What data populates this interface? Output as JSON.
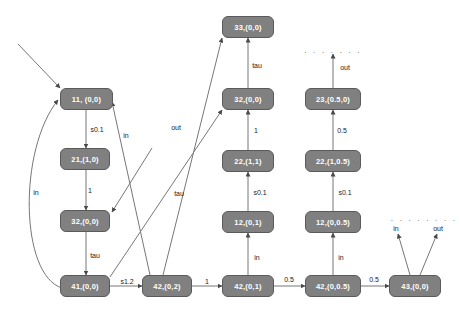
{
  "diagram": {
    "background_color": "#ffffff",
    "node_fill_color": "#808080",
    "node_text_color": "#ffffff",
    "edge_color": "#666666",
    "nodes": [
      {
        "id": "n11",
        "label": "11, (0,0)",
        "x": 60,
        "y": 88,
        "w": 53,
        "h": 22
      },
      {
        "id": "n21",
        "label": "21,(1,0)",
        "x": 60,
        "y": 148,
        "w": 50,
        "h": 22
      },
      {
        "id": "n32L",
        "label": "32,(0,0)",
        "x": 60,
        "y": 210,
        "w": 50,
        "h": 22
      },
      {
        "id": "n41",
        "label": "41,(0,0)",
        "x": 60,
        "y": 275,
        "w": 50,
        "h": 22
      },
      {
        "id": "n42_02",
        "label": "42,(0,2)",
        "x": 142,
        "y": 275,
        "w": 50,
        "h": 22
      },
      {
        "id": "n33",
        "label": "33,(0,0)",
        "x": 222,
        "y": 16,
        "w": 52,
        "h": 22
      },
      {
        "id": "n32M",
        "label": "32,(0,0)",
        "x": 222,
        "y": 88,
        "w": 52,
        "h": 22
      },
      {
        "id": "n22M",
        "label": "22,(1,1)",
        "x": 222,
        "y": 150,
        "w": 52,
        "h": 22
      },
      {
        "id": "n12M",
        "label": "12,(0,1)",
        "x": 222,
        "y": 211,
        "w": 52,
        "h": 22
      },
      {
        "id": "n42_01",
        "label": "42,(0,1)",
        "x": 222,
        "y": 275,
        "w": 52,
        "h": 22
      },
      {
        "id": "n23R",
        "label": "23,(0.5,0)",
        "x": 305,
        "y": 88,
        "w": 56,
        "h": 22
      },
      {
        "id": "n22R",
        "label": "22,(1,0.5)",
        "x": 305,
        "y": 150,
        "w": 56,
        "h": 22
      },
      {
        "id": "n12R",
        "label": "12,(0,0.5)",
        "x": 305,
        "y": 211,
        "w": 56,
        "h": 22
      },
      {
        "id": "n42_005",
        "label": "42,(0,0.5)",
        "x": 305,
        "y": 275,
        "w": 56,
        "h": 22
      },
      {
        "id": "n43",
        "label": "43,(0,0)",
        "x": 389,
        "y": 275,
        "w": 52,
        "h": 22
      }
    ],
    "edge_labels": [
      {
        "id": "lbl_s01_left",
        "text": "s0.1",
        "x": 97,
        "y": 129
      },
      {
        "id": "lbl_1_left",
        "text": "1",
        "x": 90,
        "y": 190
      },
      {
        "id": "lbl_tau_left",
        "text": "tau",
        "x": 95,
        "y": 255
      },
      {
        "id": "lbl_in_loop",
        "text": "in",
        "x": 36,
        "y": 192
      },
      {
        "id": "lbl_in_diag",
        "text": "in",
        "x": 126,
        "y": 135
      },
      {
        "id": "lbl_out_diag",
        "text": "out",
        "x": 176,
        "y": 127
      },
      {
        "id": "lbl_tau_diag",
        "text": "tau",
        "x": 179,
        "y": 193
      },
      {
        "id": "lbl_s12",
        "text": "s1.2",
        "x": 127,
        "y": 281
      },
      {
        "id": "lbl_1_bottom",
        "text": "1",
        "x": 207,
        "y": 281
      },
      {
        "id": "lbl_tau_mid",
        "text": "tau",
        "x": 257,
        "y": 65
      },
      {
        "id": "lbl_1_mid",
        "text": "1",
        "x": 256,
        "y": 130
      },
      {
        "id": "lbl_s01_mid",
        "text": "s0.1",
        "x": 260,
        "y": 192
      },
      {
        "id": "lbl_in_mid",
        "text": "in",
        "x": 257,
        "y": 257
      },
      {
        "id": "lbl_05_b1",
        "text": "0.5",
        "x": 289,
        "y": 279
      },
      {
        "id": "lbl_out_right",
        "text": "out",
        "x": 345,
        "y": 67
      },
      {
        "id": "lbl_05_right",
        "text": "0.5",
        "x": 342,
        "y": 130
      },
      {
        "id": "lbl_s01_right",
        "text": "s0.1",
        "x": 345,
        "y": 192
      },
      {
        "id": "lbl_in_right",
        "text": "in",
        "x": 341,
        "y": 257
      },
      {
        "id": "lbl_05_b2",
        "text": "0.5",
        "x": 374,
        "y": 279
      },
      {
        "id": "lbl_in_far",
        "text": "in",
        "x": 396,
        "y": 228
      },
      {
        "id": "lbl_out_far",
        "text": "out",
        "x": 438,
        "y": 228
      }
    ],
    "dotted_markers": [
      {
        "id": "dots_right_col",
        "text": ". . . . . . .",
        "x": 333,
        "y": 50
      },
      {
        "id": "dots_far_right",
        "text": ". . . . . . . .",
        "x": 424,
        "y": 218
      }
    ]
  }
}
